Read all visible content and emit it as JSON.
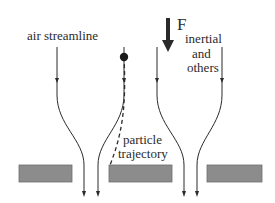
{
  "labels": {
    "air_streamline": "air streamline",
    "force_symbol": "F",
    "force_subscript_line1": "inertial",
    "force_subscript_line2": "and",
    "force_subscript_line3": "others",
    "particle_line1": "particle",
    "particle_line2": "trajectory"
  },
  "colors": {
    "line": "#2a2a2a",
    "obstacle_fill": "#8c8c8c",
    "obstacle_stroke": "#6e6e6e",
    "particle": "#1a1a1a"
  }
}
